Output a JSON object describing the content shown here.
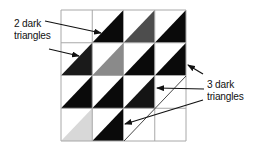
{
  "diagram": {
    "grid": {
      "rows": 4,
      "cols": 4,
      "origin": [
        61,
        10
      ],
      "cell_width": 31.25,
      "cell_height": 32.75,
      "line_color": "#a8a8a8",
      "cells": [
        [
          {
            "fill": null
          },
          {
            "fill": "#0a0a0a"
          },
          {
            "fill": "#4d4d4d"
          },
          {
            "fill": "#0a0a0a"
          }
        ],
        [
          {
            "fill": "#1a1a1a"
          },
          {
            "fill": "#8a8a8a"
          },
          {
            "fill": "#0a0a0a"
          },
          {
            "fill": "#0a0a0a"
          }
        ],
        [
          {
            "fill": "#0a0a0a"
          },
          {
            "fill": "#0a0a0a"
          },
          {
            "fill": "#141414"
          },
          {
            "fill": null
          }
        ],
        [
          {
            "fill": "#d8d8d8"
          },
          {
            "fill": "#0a0a0a"
          },
          {
            "fill": null
          },
          {
            "fill": null
          }
        ]
      ]
    },
    "outline_diagonal": {
      "from": [
        124,
        141
      ],
      "to": [
        186,
        76
      ],
      "color": "#333333"
    },
    "labels": {
      "left": {
        "line1": "2 dark",
        "line2": "triangles"
      },
      "right": {
        "line1": "3 dark",
        "line2": "triangles"
      }
    },
    "arrows": [
      {
        "name": "arrow-left-top",
        "from": [
          45,
          21
        ],
        "to": [
          101,
          33
        ]
      },
      {
        "name": "arrow-left-bottom",
        "from": [
          49,
          49
        ],
        "to": [
          79,
          56
        ]
      },
      {
        "name": "arrow-right-top",
        "from": [
          203,
          74
        ],
        "to": [
          188,
          65
        ]
      },
      {
        "name": "arrow-right-middle",
        "from": [
          204,
          89
        ],
        "to": [
          157,
          88
        ]
      },
      {
        "name": "arrow-right-bottom",
        "from": [
          203,
          100
        ],
        "to": [
          125,
          124
        ]
      }
    ]
  }
}
